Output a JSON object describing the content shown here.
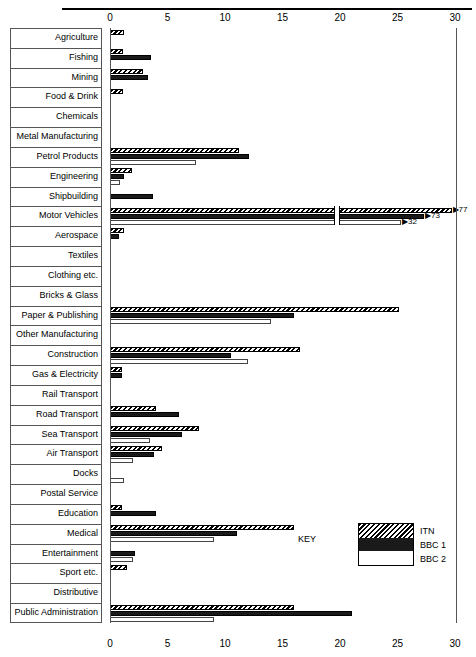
{
  "chart_data": {
    "type": "bar",
    "orientation": "horizontal",
    "title": "",
    "xlabel": "",
    "ylabel": "",
    "xlim": [
      0,
      30
    ],
    "xticks": [
      0,
      5,
      10,
      15,
      20,
      25,
      30
    ],
    "grid": false,
    "axis_duplicated_top_and_bottom": true,
    "legend_position": "bottom-right",
    "legend_title": "KEY",
    "series_names": [
      "ITN",
      "BBC 1",
      "BBC 2"
    ],
    "series_styles": [
      "diagonal-hatch",
      "solid-black",
      "white-outline"
    ],
    "categories": [
      "Agriculture",
      "Fishing",
      "Mining",
      "Food & Drink",
      "Chemicals",
      "Metal Manufacturing",
      "Petrol Products",
      "Engineering",
      "Shipbuilding",
      "Motor Vehicles",
      "Aerospace",
      "Textiles",
      "Clothing etc.",
      "Bricks & Glass",
      "Paper & Publishing",
      "Other Manufacturing",
      "Construction",
      "Gas & Electricity",
      "Rail Transport",
      "Road Transport",
      "Sea Transport",
      "Air Transport",
      "Docks",
      "Postal Service",
      "Education",
      "Medical",
      "Entertainment",
      "Sport etc.",
      "Distributive",
      "Public Administration"
    ],
    "series": [
      {
        "name": "ITN",
        "values": [
          1.2,
          1.1,
          2.9,
          1.1,
          0,
          0,
          11.2,
          1.9,
          0,
          77,
          1.2,
          0,
          0,
          0,
          25.1,
          0,
          16.5,
          1.0,
          0,
          4.0,
          7.7,
          4.5,
          0,
          0,
          1.0,
          16.0,
          0,
          1.5,
          0,
          16.0
        ]
      },
      {
        "name": "BBC 1",
        "values": [
          0,
          3.6,
          3.3,
          0,
          0,
          0,
          12.1,
          1.2,
          3.7,
          73,
          0.8,
          0,
          0,
          0,
          16.0,
          0,
          10.5,
          1.0,
          0,
          6.0,
          6.3,
          3.8,
          0,
          0,
          4.0,
          11.0,
          2.2,
          0,
          0,
          21.0
        ]
      },
      {
        "name": "BBC 2",
        "values": [
          0,
          0,
          0,
          0,
          0,
          0,
          7.5,
          0.9,
          0,
          32,
          0,
          0,
          0,
          0,
          14.0,
          0,
          12.0,
          0,
          0,
          0,
          3.5,
          2.0,
          1.2,
          0,
          0,
          9.0,
          2.0,
          0,
          0,
          9.0
        ]
      }
    ],
    "overflow_annotations": [
      {
        "category": "Motor Vehicles",
        "series": "ITN",
        "label": "77"
      },
      {
        "category": "Motor Vehicles",
        "series": "BBC 1",
        "label": "73"
      },
      {
        "category": "Motor Vehicles",
        "series": "BBC 2",
        "label": "32"
      }
    ],
    "axis_break": {
      "category": "Motor Vehicles",
      "at_value": 19.5
    }
  },
  "legend": {
    "title": "KEY",
    "entries": [
      {
        "label": "ITN",
        "style": "diagonal-hatch"
      },
      {
        "label": "BBC 1",
        "style": "solid-black"
      },
      {
        "label": "BBC 2",
        "style": "white-outline"
      }
    ]
  }
}
